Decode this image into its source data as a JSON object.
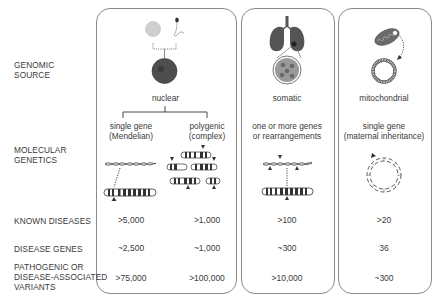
{
  "row_labels": {
    "genomic_source": "GENOMIC\nSOURCE",
    "molecular_genetics": "MOLECULAR\nGENETICS",
    "known_diseases": "KNOWN DISEASES",
    "disease_genes": "DISEASE GENES",
    "variants": "PATHOGENIC OR\nDISEASE-ASSOCIATED\nVARIANTS"
  },
  "columns": {
    "nuclear": {
      "source": "nuclear",
      "single_gene": {
        "genetics": "single gene\n(Mendelian)",
        "known_diseases": ">5,000",
        "disease_genes": "~2,500",
        "variants": ">75,000"
      },
      "polygenic": {
        "genetics": "polygenic\n(complex)",
        "known_diseases": ">1,000",
        "disease_genes": "~1,000",
        "variants": ">100,000"
      }
    },
    "somatic": {
      "source": "somatic",
      "genetics": "one or more genes\nor rearrangements",
      "known_diseases": ">100",
      "disease_genes": "~300",
      "variants": ">10,000"
    },
    "mitochondrial": {
      "source": "mitochondrial",
      "genetics": "single gene\n(maternal inheritance)",
      "known_diseases": ">20",
      "disease_genes": "36",
      "variants": "~300"
    }
  },
  "colors": {
    "border": "#8a8a8a",
    "text": "#3a3a3a",
    "cell_dark": "#555555",
    "cell_light": "#c8c8c8",
    "tissue": "#8c8c8c"
  }
}
